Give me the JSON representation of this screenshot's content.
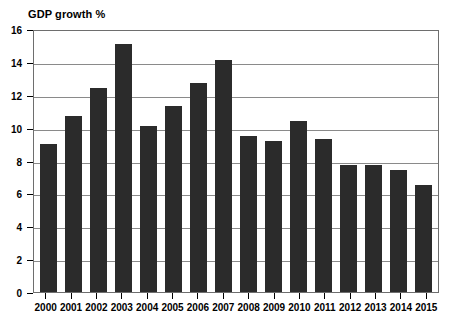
{
  "chart_data": {
    "type": "bar",
    "title": "GDP growth %",
    "xlabel": "",
    "ylabel": "",
    "ylim": [
      0,
      16
    ],
    "ytick_step": 2,
    "yticks": [
      0,
      2,
      4,
      6,
      8,
      10,
      12,
      14,
      16
    ],
    "grid": true,
    "legend": null,
    "bar_color": "#2b2b2b",
    "categories": [
      "2000",
      "2001",
      "2002",
      "2003",
      "2004",
      "2005",
      "2006",
      "2007",
      "2008",
      "2009",
      "2010",
      "2011",
      "2012",
      "2013",
      "2014",
      "2015"
    ],
    "values": [
      9.0,
      10.7,
      12.4,
      15.1,
      10.1,
      11.3,
      12.7,
      14.1,
      9.5,
      9.2,
      10.4,
      9.3,
      7.7,
      7.7,
      7.4,
      6.5
    ]
  }
}
